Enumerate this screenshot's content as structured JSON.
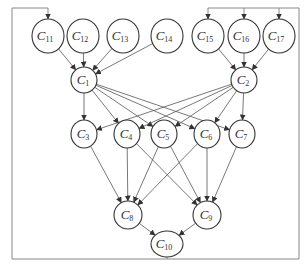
{
  "diagram": {
    "title": "",
    "nodes": [
      {
        "id": "C11",
        "base": "C",
        "sub": "11",
        "x": 48,
        "y": 36,
        "rx": 16,
        "ry": 17
      },
      {
        "id": "C12",
        "base": "C",
        "sub": "12",
        "x": 83,
        "y": 36,
        "rx": 16,
        "ry": 17
      },
      {
        "id": "C13",
        "base": "C",
        "sub": "13",
        "x": 123,
        "y": 36,
        "rx": 16,
        "ry": 17
      },
      {
        "id": "C14",
        "base": "C",
        "sub": "14",
        "x": 167,
        "y": 36,
        "rx": 16,
        "ry": 17
      },
      {
        "id": "C15",
        "base": "C",
        "sub": "15",
        "x": 208,
        "y": 36,
        "rx": 16,
        "ry": 17
      },
      {
        "id": "C16",
        "base": "C",
        "sub": "16",
        "x": 244,
        "y": 36,
        "rx": 16,
        "ry": 17
      },
      {
        "id": "C17",
        "base": "C",
        "sub": "17",
        "x": 279,
        "y": 36,
        "rx": 16,
        "ry": 17
      },
      {
        "id": "C1",
        "base": "C",
        "sub": "1",
        "x": 84,
        "y": 80,
        "rx": 13,
        "ry": 13
      },
      {
        "id": "C2",
        "base": "C",
        "sub": "2",
        "x": 244,
        "y": 80,
        "rx": 13,
        "ry": 13
      },
      {
        "id": "C3",
        "base": "C",
        "sub": "3",
        "x": 84,
        "y": 134,
        "rx": 13,
        "ry": 14
      },
      {
        "id": "C4",
        "base": "C",
        "sub": "4",
        "x": 127,
        "y": 134,
        "rx": 13,
        "ry": 14
      },
      {
        "id": "C5",
        "base": "C",
        "sub": "5",
        "x": 164,
        "y": 134,
        "rx": 13,
        "ry": 14
      },
      {
        "id": "C6",
        "base": "C",
        "sub": "6",
        "x": 207,
        "y": 134,
        "rx": 13,
        "ry": 14
      },
      {
        "id": "C7",
        "base": "C",
        "sub": "7",
        "x": 242,
        "y": 134,
        "rx": 13,
        "ry": 14
      },
      {
        "id": "C8",
        "base": "C",
        "sub": "8",
        "x": 128,
        "y": 215,
        "rx": 14,
        "ry": 14
      },
      {
        "id": "C9",
        "base": "C",
        "sub": "9",
        "x": 207,
        "y": 215,
        "rx": 14,
        "ry": 14
      },
      {
        "id": "C10",
        "base": "C",
        "sub": "10",
        "x": 167,
        "y": 244,
        "rx": 16,
        "ry": 13
      }
    ],
    "edges": [
      [
        "C11",
        "C1"
      ],
      [
        "C12",
        "C1"
      ],
      [
        "C13",
        "C1"
      ],
      [
        "C14",
        "C1"
      ],
      [
        "C15",
        "C2"
      ],
      [
        "C16",
        "C2"
      ],
      [
        "C17",
        "C2"
      ],
      [
        "C1",
        "C3"
      ],
      [
        "C1",
        "C4"
      ],
      [
        "C1",
        "C5"
      ],
      [
        "C1",
        "C6"
      ],
      [
        "C1",
        "C7"
      ],
      [
        "C2",
        "C3"
      ],
      [
        "C2",
        "C4"
      ],
      [
        "C2",
        "C5"
      ],
      [
        "C2",
        "C6"
      ],
      [
        "C2",
        "C7"
      ],
      [
        "C3",
        "C8"
      ],
      [
        "C4",
        "C8"
      ],
      [
        "C5",
        "C8"
      ],
      [
        "C6",
        "C8"
      ],
      [
        "C4",
        "C9"
      ],
      [
        "C5",
        "C9"
      ],
      [
        "C6",
        "C9"
      ],
      [
        "C7",
        "C9"
      ],
      [
        "C8",
        "C10"
      ],
      [
        "C9",
        "C10"
      ]
    ],
    "feedback": {
      "from": "C10",
      "bottom_y": 259,
      "left_x": 12,
      "right_x": 299,
      "top_y": 8,
      "left_targets": [
        "C11"
      ],
      "right_targets": [
        "C15",
        "C16",
        "C17"
      ]
    }
  }
}
